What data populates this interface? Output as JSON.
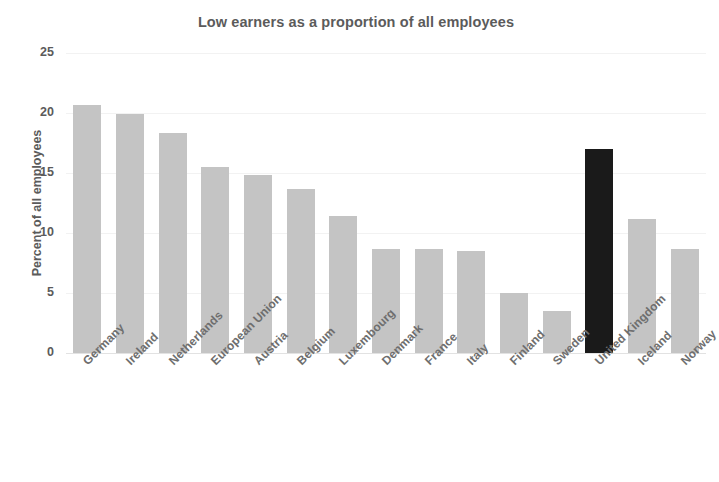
{
  "chart_data": {
    "type": "bar",
    "title": "Low earners as a proportion of all employees",
    "xlabel": "",
    "ylabel": "Percent of all employees",
    "ylim": [
      0,
      25
    ],
    "yticks": [
      0,
      5,
      10,
      15,
      20,
      25
    ],
    "grid": true,
    "legend": "none",
    "categories": [
      "Germany",
      "Ireland",
      "Netherlands",
      "European Union",
      "Austria",
      "Belgium",
      "Luxembourg",
      "Denmark",
      "France",
      "Italy",
      "Finland",
      "Sweden",
      "United Kingdom",
      "Iceland",
      "Norway"
    ],
    "values": [
      20.7,
      19.9,
      18.3,
      15.5,
      14.8,
      13.7,
      11.4,
      8.7,
      8.7,
      8.5,
      5.0,
      3.5,
      17.0,
      11.2,
      8.7
    ],
    "highlight_category": "United Kingdom",
    "colors": {
      "bar": "#c4c4c4",
      "bar_highlight": "#1a1a1a",
      "text": "#5b5b5b",
      "tick_text": "#6e6e6e",
      "gridline": "#f2f2f2",
      "axis": "#e2e2e2",
      "background": "#ffffff"
    }
  }
}
